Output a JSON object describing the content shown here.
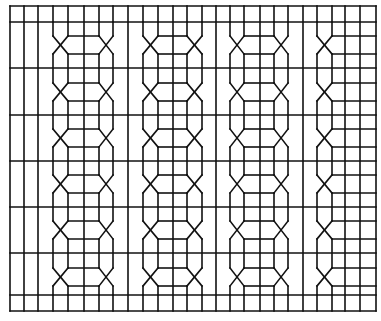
{
  "figure": {
    "width": 381,
    "height": 321,
    "stroke_color": "#111111",
    "stroke_width": 1.6,
    "background": "#ffffff"
  },
  "frame": {
    "left": 10,
    "right": 376,
    "top": 6,
    "bottom": 311
  },
  "horizontals": [
    6,
    22,
    68,
    115,
    161,
    207,
    253,
    295,
    311
  ],
  "plain_verticals": [
    10,
    24,
    38,
    128,
    216,
    303,
    345,
    360,
    376
  ],
  "top_band": {
    "y1": 6,
    "y2": 22
  },
  "bottom_band": {
    "y1": 295,
    "y2": 311
  },
  "crossings": [
    45,
    92,
    138,
    184,
    230,
    277
  ],
  "crossing_half_height": 9,
  "chains": [
    {
      "name": "chain-1",
      "outer_left": 53,
      "inner_left": 68,
      "center": 84,
      "inner_right": 99,
      "outer_right": 113
    },
    {
      "name": "chain-2",
      "outer_left": 143,
      "inner_left": 158,
      "center": 173,
      "inner_right": 187,
      "outer_right": 202
    },
    {
      "name": "chain-3",
      "outer_left": 230,
      "inner_left": 244,
      "center": 260,
      "inner_right": 274,
      "outer_right": 288
    }
  ],
  "half_chain": {
    "name": "half-chain-right",
    "outer_left": 317,
    "inner_left": 332,
    "grid_right": 376
  }
}
